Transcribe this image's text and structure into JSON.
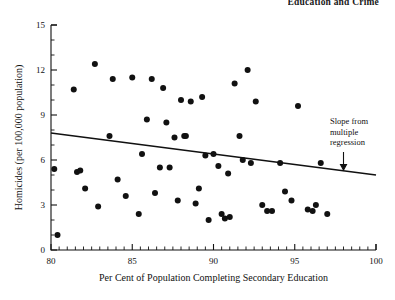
{
  "page": {
    "running_head": "Education and Crime"
  },
  "chart_data": {
    "type": "scatter",
    "title": "",
    "xlabel": "Per Cent of Population Completing Secondary Education",
    "ylabel": "Homicides (per 100,000 population)",
    "xlim": [
      80,
      100
    ],
    "ylim": [
      0,
      15
    ],
    "xticks": [
      80,
      85,
      90,
      95,
      100
    ],
    "yticks": [
      0,
      3,
      6,
      9,
      12,
      15
    ],
    "x_minor_tick_step": 0.5,
    "y_minor_tick_step": 1,
    "grid": false,
    "legend": null,
    "marker": "filled-circle",
    "marker_color": "#111111",
    "points": [
      [
        80.2,
        5.4
      ],
      [
        80.4,
        1.0
      ],
      [
        81.4,
        10.7
      ],
      [
        81.6,
        5.2
      ],
      [
        81.8,
        5.3
      ],
      [
        82.1,
        4.1
      ],
      [
        82.7,
        12.4
      ],
      [
        82.9,
        2.9
      ],
      [
        83.6,
        7.6
      ],
      [
        83.8,
        11.4
      ],
      [
        84.1,
        4.7
      ],
      [
        84.6,
        3.6
      ],
      [
        85.0,
        11.5
      ],
      [
        85.4,
        2.4
      ],
      [
        85.6,
        6.4
      ],
      [
        85.9,
        8.7
      ],
      [
        86.2,
        11.4
      ],
      [
        86.4,
        3.8
      ],
      [
        86.7,
        5.5
      ],
      [
        86.9,
        10.8
      ],
      [
        87.1,
        8.5
      ],
      [
        87.3,
        5.5
      ],
      [
        87.6,
        7.5
      ],
      [
        87.8,
        3.3
      ],
      [
        88.0,
        10.0
      ],
      [
        88.2,
        7.6
      ],
      [
        88.3,
        7.6
      ],
      [
        88.6,
        9.9
      ],
      [
        88.9,
        3.1
      ],
      [
        89.1,
        4.1
      ],
      [
        89.3,
        10.2
      ],
      [
        89.5,
        6.3
      ],
      [
        89.7,
        2.0
      ],
      [
        90.0,
        6.4
      ],
      [
        90.3,
        5.6
      ],
      [
        90.5,
        2.4
      ],
      [
        90.7,
        2.1
      ],
      [
        90.9,
        5.1
      ],
      [
        91.0,
        2.2
      ],
      [
        91.3,
        11.1
      ],
      [
        91.6,
        7.6
      ],
      [
        91.8,
        6.0
      ],
      [
        92.1,
        12.0
      ],
      [
        92.3,
        5.8
      ],
      [
        92.6,
        9.9
      ],
      [
        93.0,
        3.0
      ],
      [
        93.3,
        2.6
      ],
      [
        93.6,
        2.6
      ],
      [
        94.1,
        5.8
      ],
      [
        94.4,
        3.9
      ],
      [
        94.8,
        3.3
      ],
      [
        95.2,
        9.6
      ],
      [
        95.8,
        2.7
      ],
      [
        96.1,
        2.6
      ],
      [
        96.3,
        3.0
      ],
      [
        96.6,
        5.8
      ],
      [
        97.0,
        2.4
      ]
    ],
    "trend_line": {
      "label": "Slope from multiple regression",
      "x_start": 80,
      "y_start": 7.8,
      "x_end": 100,
      "y_end": 5.0
    },
    "annotation": {
      "lines": [
        "Slope from",
        "multiple",
        "regression"
      ],
      "arrow_target_x": 98.0,
      "arrow_target_y": 5.3
    }
  }
}
